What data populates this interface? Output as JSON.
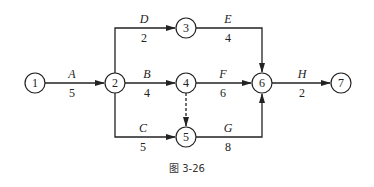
{
  "diagram": {
    "type": "activity-on-arrow network",
    "caption": "图 3-26",
    "nodes": [
      {
        "id": "1",
        "x": 35,
        "y": 83
      },
      {
        "id": "2",
        "x": 115,
        "y": 83
      },
      {
        "id": "3",
        "x": 186,
        "y": 28
      },
      {
        "id": "4",
        "x": 186,
        "y": 83
      },
      {
        "id": "5",
        "x": 186,
        "y": 137
      },
      {
        "id": "6",
        "x": 262,
        "y": 83
      },
      {
        "id": "7",
        "x": 341,
        "y": 83
      }
    ],
    "activities": [
      {
        "name": "A",
        "duration": "5",
        "from": "1",
        "to": "2"
      },
      {
        "name": "D",
        "duration": "2",
        "from": "2",
        "to": "3"
      },
      {
        "name": "B",
        "duration": "4",
        "from": "2",
        "to": "4"
      },
      {
        "name": "C",
        "duration": "5",
        "from": "2",
        "to": "5"
      },
      {
        "name": "E",
        "duration": "4",
        "from": "3",
        "to": "6"
      },
      {
        "name": "F",
        "duration": "6",
        "from": "4",
        "to": "6"
      },
      {
        "name": "G",
        "duration": "8",
        "from": "5",
        "to": "6"
      },
      {
        "name": "H",
        "duration": "2",
        "from": "6",
        "to": "7"
      }
    ],
    "dummy_activities": [
      {
        "from": "4",
        "to": "5",
        "style": "dashed"
      }
    ]
  }
}
